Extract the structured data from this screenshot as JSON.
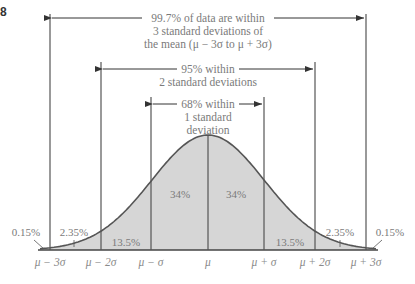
{
  "figure_label": "8",
  "annotations": {
    "three_sigma": [
      "99.7% of data are within",
      "3 standard deviations of",
      "the mean (μ − 3σ to μ + 3σ)"
    ],
    "two_sigma": [
      "95% within",
      "2 standard deviations"
    ],
    "one_sigma": [
      "68% within",
      "1 standard",
      "deviation"
    ]
  },
  "regions": {
    "left_tail": "0.15%",
    "left_2_3": "2.35%",
    "left_1_2": "13.5%",
    "left_0_1": "34%",
    "right_0_1": "34%",
    "right_1_2": "13.5%",
    "right_2_3": "2.35%",
    "right_tail": "0.15%"
  },
  "axis_labels": {
    "m3": "μ − 3σ",
    "m2": "μ − 2σ",
    "m1": "μ − σ",
    "mu": "μ",
    "p1": "μ + σ",
    "p2": "μ + 2σ",
    "p3": "μ + 3σ"
  },
  "colors": {
    "fill": "#d6d6d6",
    "curve": "#555555",
    "line": "#555555",
    "text": "#7a7a7a"
  }
}
